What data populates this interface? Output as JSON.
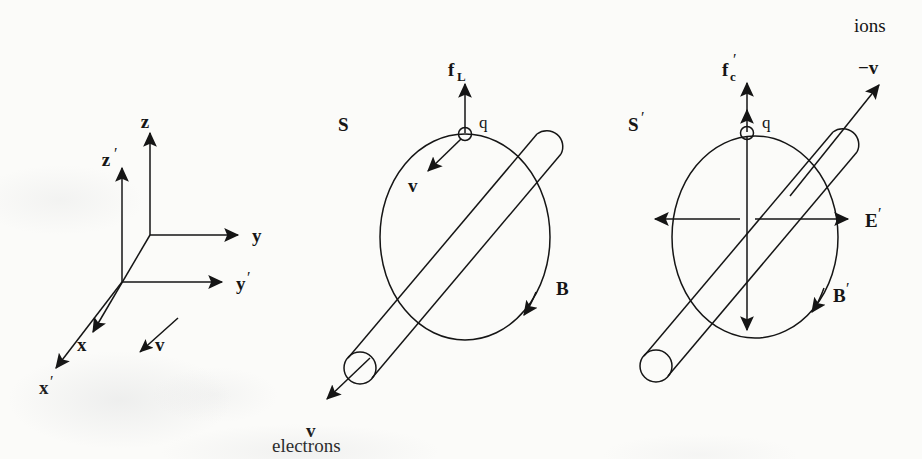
{
  "figure": {
    "background_color": "#fbfbf9",
    "ink_color": "#151515"
  },
  "axes_panel": {
    "name": "coordinate-axes",
    "labels": {
      "z": "z",
      "z_prime": "z",
      "y": "y",
      "y_prime": "y",
      "x": "x",
      "x_prime": "x",
      "v": "v",
      "prime_mark": "′"
    }
  },
  "frame_s": {
    "name": "lab-frame",
    "frame_label": "S",
    "charge_label": "q",
    "force_label": "f",
    "force_subscript": "L",
    "velocity_label": "v",
    "field_label": "B",
    "wire_velocity_label": "v",
    "carrier_label": "electrons"
  },
  "frame_s_prime": {
    "name": "moving-frame",
    "frame_label": "S",
    "frame_prime": "′",
    "charge_label": "q",
    "force_label": "f",
    "force_subscript": "c",
    "force_prime": "′",
    "electric_field_label": "E",
    "electric_field_prime": "′",
    "magnetic_field_label": "B",
    "magnetic_field_prime": "′",
    "wire_velocity_label": "−v",
    "carrier_label": "ions"
  }
}
